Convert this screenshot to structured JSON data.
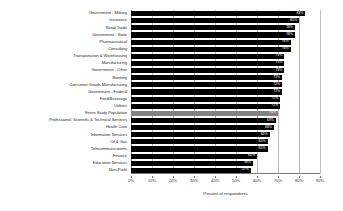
{
  "chart_data": {
    "type": "bar",
    "orientation": "horizontal",
    "title": "",
    "xlabel": "Percent of respondents",
    "ylabel": "",
    "xlim": [
      0,
      90
    ],
    "xticks": [
      0,
      10,
      20,
      30,
      40,
      50,
      60,
      70,
      80,
      90
    ],
    "xtick_labels": [
      "0%",
      "10%",
      "20%",
      "30%",
      "40%",
      "50%",
      "60%",
      "70%",
      "80%",
      "90%"
    ],
    "grid": true,
    "legend": "none",
    "bar_color": "#000000",
    "highlight_color": "#828282",
    "highlight_category": "Entire Study Population",
    "categories": [
      "Government - Military",
      "Insurance",
      "Retail Trade",
      "Government - State",
      "Pharmaceutical",
      "Consulting",
      "Transportation & Warehousing",
      "Manufacturing",
      "Government - Other",
      "Banking",
      "Consumer Goods Manufacturing",
      "Government - Federal",
      "Food/Beverage",
      "Utilities",
      "Entire Study Population",
      "Professional, Scientific & Technical Services",
      "Health Care",
      "Information Services",
      "Oil & Gas",
      "Telecommunications",
      "Finance",
      "Education Services",
      "Non-Profit"
    ],
    "values": [
      83,
      80,
      78,
      78,
      76,
      76,
      73,
      73,
      73,
      72,
      72,
      72,
      71,
      71,
      70,
      69,
      68,
      66,
      65,
      65,
      60,
      58,
      57
    ],
    "value_labels": [
      "83%",
      "80%",
      "78%",
      "78%",
      "76%",
      "76%",
      "73%",
      "73%",
      "73%",
      "72%",
      "72%",
      "72%",
      "71%",
      "71%",
      "70%",
      "69%",
      "68%",
      "66%",
      "65%",
      "65%",
      "60%",
      "58%",
      "57%"
    ]
  }
}
